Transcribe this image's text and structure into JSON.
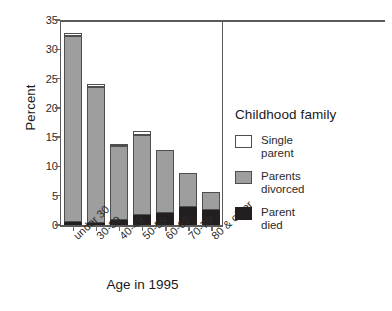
{
  "chart_data": {
    "type": "bar",
    "subtype": "stacked-vertical",
    "title": "",
    "xlabel": "Age in 1995",
    "ylabel": "Percent",
    "ylim": [
      0,
      35
    ],
    "yticks": [
      0,
      5,
      10,
      15,
      20,
      25,
      30,
      35
    ],
    "grid": false,
    "categories": [
      "under 30",
      "30-39",
      "40-49",
      "50-59",
      "60-69",
      "70-79",
      "80 & older"
    ],
    "series": [
      {
        "name": "Parent died",
        "key": "died",
        "color": "#231f20",
        "values": [
          0.6,
          0.4,
          0.9,
          1.7,
          2.1,
          3.0,
          2.6
        ]
      },
      {
        "name": "Parents divorced",
        "key": "divorced",
        "color": "#9e9e9e",
        "values": [
          31.7,
          23.1,
          12.6,
          13.7,
          10.7,
          5.8,
          3.0
        ]
      },
      {
        "name": "Single parent",
        "key": "single",
        "color": "#ffffff",
        "values": [
          0.5,
          0.6,
          0.4,
          0.7,
          0.0,
          0.0,
          0.0
        ]
      }
    ],
    "totals": [
      32.8,
      24.1,
      13.9,
      16.1,
      12.8,
      8.8,
      5.6
    ],
    "legend": {
      "title": "Childhood family",
      "position": "right",
      "entries": [
        {
          "label_line1": "Single",
          "label_line2": "parent",
          "key": "single"
        },
        {
          "label_line1": "Parents",
          "label_line2": "divorced",
          "key": "divorced"
        },
        {
          "label_line1": "Parent",
          "label_line2": "died",
          "key": "died"
        }
      ]
    }
  },
  "axis": {
    "y_title": "Percent",
    "x_title": "Age in 1995",
    "y_tick_labels": [
      "0",
      "5",
      "10",
      "15",
      "20",
      "25",
      "30",
      "35"
    ],
    "x_tick_labels": [
      "under 30",
      "30-39",
      "40-49",
      "50-59",
      "60-69",
      "70-79",
      "80 & older"
    ]
  },
  "legend": {
    "title": "Childhood family",
    "items": [
      {
        "line1": "Single",
        "line2": "parent"
      },
      {
        "line1": "Parents",
        "line2": "divorced"
      },
      {
        "line1": "Parent",
        "line2": "died"
      }
    ]
  },
  "colors": {
    "single_parent": "#ffffff",
    "parents_divorced": "#9e9e9e",
    "parent_died": "#231f20",
    "axis": "#5a5a5a",
    "text": "#1a1a1a"
  }
}
